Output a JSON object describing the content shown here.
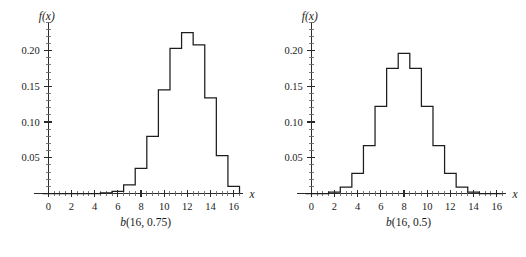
{
  "figure": {
    "background_color": "#ffffff",
    "line_color": "#1d1d1d",
    "panels": [
      {
        "id": "left",
        "caption_var": "b",
        "caption_args": "(16, 0.75)",
        "ylabel": "f(x)",
        "xlabel": "x"
      },
      {
        "id": "right",
        "caption_var": "b",
        "caption_args": "(16, 0.5)",
        "ylabel": "f(x)",
        "xlabel": "x"
      }
    ]
  },
  "chart_data": [
    {
      "type": "bar",
      "title": "b(16, 0.75)",
      "subtitle": "",
      "xlabel": "x",
      "ylabel": "f(x)",
      "categories": [
        0,
        1,
        2,
        3,
        4,
        5,
        6,
        7,
        8,
        9,
        10,
        11,
        12,
        13,
        14,
        15,
        16
      ],
      "values": [
        0.0,
        0.0,
        0.0,
        0.0,
        0.0,
        0.001,
        0.003,
        0.012,
        0.035,
        0.08,
        0.145,
        0.203,
        0.225,
        0.208,
        0.134,
        0.053,
        0.01
      ],
      "xlim": [
        -0.5,
        16.8
      ],
      "ylim": [
        0,
        0.24
      ],
      "xticks": [
        0,
        2,
        4,
        6,
        8,
        10,
        12,
        14,
        16
      ],
      "xticklabels": [
        "0",
        "2",
        "4",
        "6",
        "8",
        "10",
        "12",
        "14",
        "16"
      ],
      "yticks": [
        0.05,
        0.1,
        0.15,
        0.2
      ],
      "yticklabels": [
        "0.05",
        "0.10",
        "0.15",
        "0.20"
      ],
      "yminor_step": 0.01,
      "xminor_step": 0.5,
      "grid": false,
      "legend": "none",
      "bar_width": 1.0,
      "bar_fill": "none",
      "bar_edge": "#1d1d1d"
    },
    {
      "type": "bar",
      "title": "b(16, 0.5)",
      "subtitle": "",
      "xlabel": "x",
      "ylabel": "f(x)",
      "categories": [
        0,
        1,
        2,
        3,
        4,
        5,
        6,
        7,
        8,
        9,
        10,
        11,
        12,
        13,
        14,
        15,
        16
      ],
      "values": [
        0.0,
        0.0,
        0.002,
        0.009,
        0.028,
        0.067,
        0.122,
        0.175,
        0.196,
        0.175,
        0.122,
        0.067,
        0.028,
        0.009,
        0.002,
        0.0,
        0.0
      ],
      "xlim": [
        -0.5,
        16.8
      ],
      "ylim": [
        0,
        0.24
      ],
      "xticks": [
        0,
        2,
        4,
        6,
        8,
        10,
        12,
        14,
        16
      ],
      "xticklabels": [
        "0",
        "2",
        "4",
        "6",
        "8",
        "10",
        "12",
        "14",
        "16"
      ],
      "yticks": [
        0.05,
        0.1,
        0.15,
        0.2
      ],
      "yticklabels": [
        "0.05",
        "0.10",
        "0.15",
        "0.20"
      ],
      "yminor_step": 0.01,
      "xminor_step": 0.5,
      "grid": false,
      "legend": "none",
      "bar_width": 1.0,
      "bar_fill": "none",
      "bar_edge": "#1d1d1d"
    }
  ]
}
